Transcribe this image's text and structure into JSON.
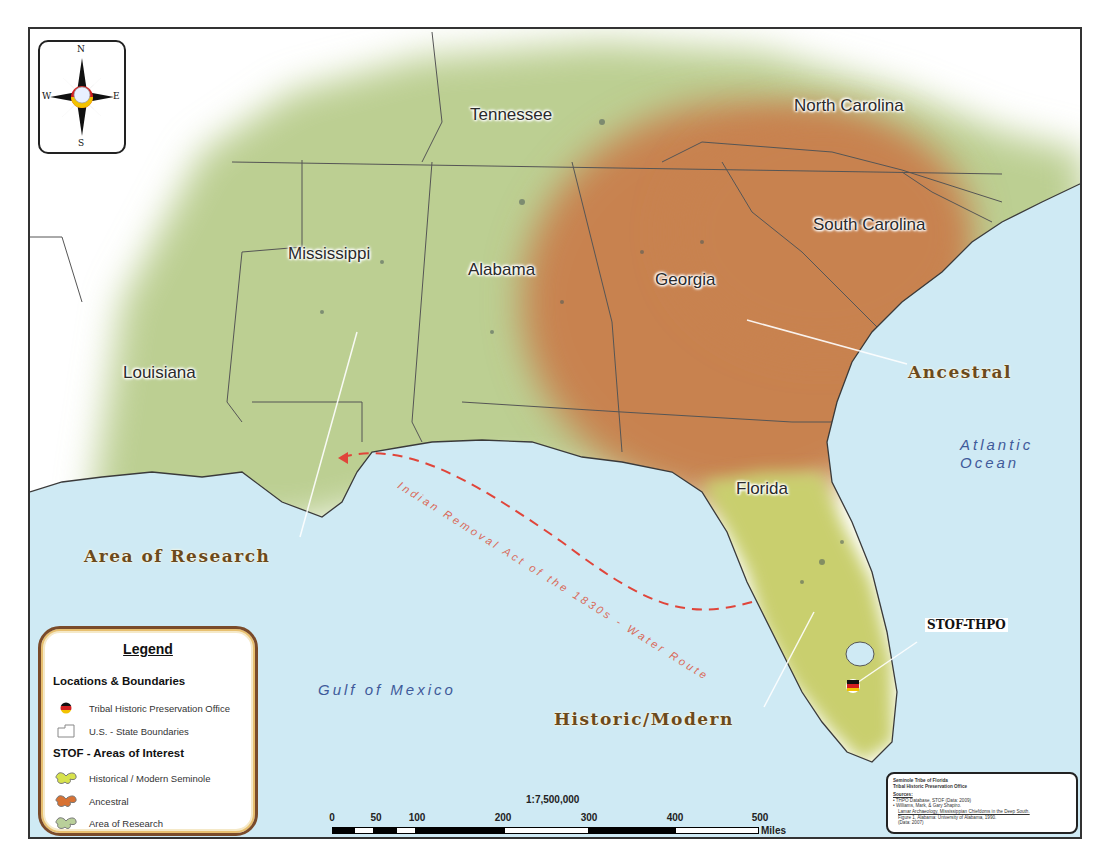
{
  "map": {
    "scale_ratio": "1:7,500,000",
    "scale_ticks": [
      "0",
      "50",
      "100",
      "200",
      "300",
      "400",
      "500"
    ],
    "scale_units": "Miles",
    "compass": {
      "n": "N",
      "s": "S",
      "e": "E",
      "w": "W"
    },
    "states": [
      {
        "name": "Tennessee"
      },
      {
        "name": "North Carolina"
      },
      {
        "name": "South Carolina"
      },
      {
        "name": "Mississippi"
      },
      {
        "name": "Alabama"
      },
      {
        "name": "Georgia"
      },
      {
        "name": "Louisiana"
      },
      {
        "name": "Florida"
      }
    ],
    "area_labels": {
      "ancestral": "Ancestral",
      "research": "Area of Research",
      "historic": "Historic/Modern"
    },
    "water_labels": {
      "atlantic_line1": "Atlantic",
      "atlantic_line2": "Ocean",
      "gulf": "Gulf of Mexico"
    },
    "route_label": "Indian Removal Act of the 1830s - Water Route",
    "office_label": "STOF-THPO",
    "colors": {
      "water": "#cfeaf4",
      "research": "#bccf92",
      "ancestral": "#c8824f",
      "historic": "#c9cf6e",
      "route": "#e0453a",
      "label_brown": "#6b4a1c"
    }
  },
  "legend": {
    "title": "Legend",
    "section1": "Locations & Boundaries",
    "items1": [
      {
        "label": "Tribal Historic Preservation Office"
      },
      {
        "label": "U.S. - State Boundaries"
      }
    ],
    "section2": "STOF - Areas of Interest",
    "items2": [
      {
        "label": "Historical / Modern Seminole"
      },
      {
        "label": "Ancestral"
      },
      {
        "label": "Area of Research"
      }
    ]
  },
  "sources": {
    "org1": "Seminole Tribe of Florida",
    "org2": "Tribal Historic Preservation Office",
    "heading": "Sources:",
    "line1": "• THPO Database, STOF (Data: 2009)",
    "line2": "• Williams, Mark, & Gary Shapiro.",
    "line3": "Lamar Archaeology, Mississippian Chiefdoms in the Deep South.",
    "line4": "Figure 1, Alabama: University of Alabama, 1990.",
    "line5": "(Data: 2007)"
  }
}
